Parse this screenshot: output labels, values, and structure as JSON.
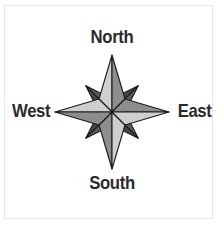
{
  "figure": {
    "kind": "compass-rose",
    "background_color": "#ffffff",
    "border_color": "#b6b6b6",
    "outline_color": "#1c1c1c"
  },
  "labels": {
    "north": "North",
    "south": "South",
    "east": "East",
    "west": "West",
    "text_color": "#2b2b2b"
  },
  "compass": {
    "center_x": 112,
    "center_y": 112,
    "cardinal_length": 57,
    "intercardinal_length": 37,
    "half_width": 13,
    "colors": {
      "light": "#cfcfcf",
      "medium": "#8d8d8d",
      "dark": "#5a5a5a",
      "darker": "#474747",
      "outline": "#1c1c1c"
    },
    "points": [
      {
        "name": "north",
        "bearing": 0,
        "class": "cardinal",
        "left_fill": "#cfcfcf",
        "right_fill": "#8d8d8d"
      },
      {
        "name": "northeast",
        "bearing": 45,
        "class": "intercardinal",
        "left_fill": "#5a5a5a",
        "right_fill": "#474747"
      },
      {
        "name": "east",
        "bearing": 90,
        "class": "cardinal",
        "left_fill": "#cfcfcf",
        "right_fill": "#8d8d8d"
      },
      {
        "name": "southeast",
        "bearing": 135,
        "class": "intercardinal",
        "left_fill": "#5a5a5a",
        "right_fill": "#474747"
      },
      {
        "name": "south",
        "bearing": 180,
        "class": "cardinal",
        "left_fill": "#cfcfcf",
        "right_fill": "#8d8d8d"
      },
      {
        "name": "southwest",
        "bearing": 225,
        "class": "intercardinal",
        "left_fill": "#5a5a5a",
        "right_fill": "#474747"
      },
      {
        "name": "west",
        "bearing": 270,
        "class": "cardinal",
        "left_fill": "#cfcfcf",
        "right_fill": "#8d8d8d"
      },
      {
        "name": "northwest",
        "bearing": 315,
        "class": "intercardinal",
        "left_fill": "#5a5a5a",
        "right_fill": "#474747"
      }
    ]
  }
}
